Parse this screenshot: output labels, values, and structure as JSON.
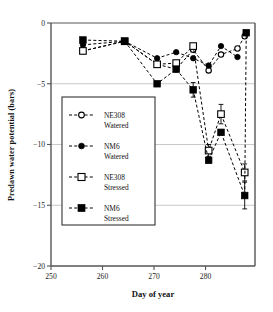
{
  "chart_data": {
    "type": "scatter",
    "title": "",
    "xlabel": "Day of year",
    "ylabel": "Predawn water potential (bars)",
    "xlim": [
      250,
      289.6
    ],
    "ylim": [
      -20,
      0
    ],
    "xticks": [
      250,
      260,
      270,
      280
    ],
    "yticks": [
      0,
      -5,
      -10,
      -15,
      -20
    ],
    "xtick_labels": [
      "250",
      "260",
      "270",
      "280"
    ],
    "ytick_labels": [
      "0",
      "−5",
      "−10",
      "−15",
      "−20"
    ],
    "grid": "horizontal gridlines at -5, -10, -15",
    "legend_position": "inside-left-middle",
    "series": [
      {
        "name": "NE308 Watered",
        "label_line1": "NE308",
        "label_line2": "Watered",
        "marker": "open-circle",
        "color": "#000000",
        "linestyle": "dashed",
        "x": [
          256.2,
          264.3,
          270.6,
          274.3,
          277.6,
          280.6,
          283.0,
          286.2,
          287.6
        ],
        "y": [
          -2.3,
          -1.5,
          -3.4,
          -3.8,
          -2.2,
          -3.9,
          -2.6,
          -2.1,
          -1.1
        ],
        "yerr": [
          0,
          0,
          0,
          0,
          0,
          0,
          0,
          0,
          0
        ]
      },
      {
        "name": "NM6 Watered",
        "label_line1": "NM6",
        "label_line2": "Watered",
        "marker": "filled-circle",
        "color": "#000000",
        "linestyle": "dashed",
        "x": [
          256.2,
          264.3,
          270.6,
          274.3,
          277.6,
          280.6,
          283.0,
          286.2
        ],
        "y": [
          -1.8,
          -1.5,
          -2.9,
          -2.4,
          -2.9,
          -3.5,
          -1.9,
          -2.8
        ],
        "yerr": [
          0,
          0,
          0,
          0,
          0,
          0,
          0,
          0
        ]
      },
      {
        "name": "NE308 Stressed",
        "label_line1": "NE308",
        "label_line2": "Stressed",
        "marker": "open-square",
        "color": "#000000",
        "linestyle": "dashed",
        "x": [
          256.2,
          264.3,
          270.6,
          274.3,
          277.6,
          280.6,
          283.0,
          287.6
        ],
        "y": [
          -2.3,
          -1.5,
          -3.4,
          -3.3,
          -1.9,
          -10.5,
          -7.5,
          -12.3
        ],
        "yerr": [
          0,
          0,
          0,
          0,
          0,
          0.5,
          0.8,
          0.7
        ]
      },
      {
        "name": "NM6 Stressed",
        "label_line1": "NM6",
        "label_line2": "Stressed",
        "marker": "filled-square",
        "color": "#000000",
        "linestyle": "dashed",
        "x": [
          256.2,
          264.3,
          270.6,
          274.3,
          277.6,
          280.6,
          283.0,
          287.6,
          287.9
        ],
        "y": [
          -1.4,
          -1.5,
          -5.0,
          -3.8,
          -5.5,
          -11.3,
          -9.0,
          -14.2,
          -0.8
        ],
        "yerr": [
          0,
          0,
          0,
          0,
          0.6,
          0,
          0,
          1.1,
          0
        ]
      }
    ]
  },
  "axes": {
    "x_title": "Day of year",
    "y_title": "Predawn water potential (bars)"
  },
  "legend": {
    "entries": [
      {
        "line1": "NE308",
        "line2": "Watered",
        "marker": "open-circle"
      },
      {
        "line1": "NM6",
        "line2": "Watered",
        "marker": "filled-circle"
      },
      {
        "line1": "NE308",
        "line2": "Stressed",
        "marker": "open-square"
      },
      {
        "line1": "NM6",
        "line2": "Stressed",
        "marker": "filled-square"
      }
    ]
  },
  "style": {
    "axis_color": "#555555",
    "grid_color": "#bbbbbb",
    "marker_color": "#000000",
    "background": "#ffffff"
  }
}
